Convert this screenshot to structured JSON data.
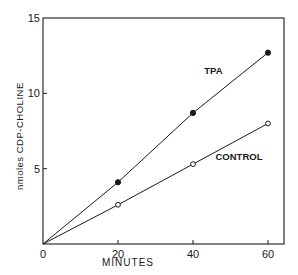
{
  "chart_data": {
    "type": "line",
    "title": "",
    "xlabel": "MINUTES",
    "ylabel": "nmoles CDP-CHOLINE",
    "xlim": [
      0,
      65
    ],
    "ylim": [
      0,
      15
    ],
    "x_ticks": [
      0,
      20,
      40,
      60
    ],
    "x_tick_labels": [
      "0",
      "20",
      "40",
      "60"
    ],
    "y_ticks": [
      5,
      10,
      15
    ],
    "y_tick_labels": [
      "5",
      "10",
      "15"
    ],
    "grid": false,
    "legend": "inline labels",
    "x": [
      0,
      20,
      40,
      60
    ],
    "series": [
      {
        "name": "TPA",
        "marker": "filled-circle",
        "values": [
          0,
          4.1,
          8.7,
          12.7
        ],
        "label_pos": {
          "x": 43,
          "y": 11.3
        }
      },
      {
        "name": "CONTROL",
        "marker": "open-circle",
        "values": [
          0,
          2.6,
          5.3,
          8.0
        ],
        "label_pos": {
          "x": 46,
          "y": 5.6
        }
      }
    ],
    "annotations": [
      "TPA",
      "CONTROL"
    ]
  },
  "colors": {
    "line": "#1a1a1a",
    "background": "#ffffff"
  }
}
